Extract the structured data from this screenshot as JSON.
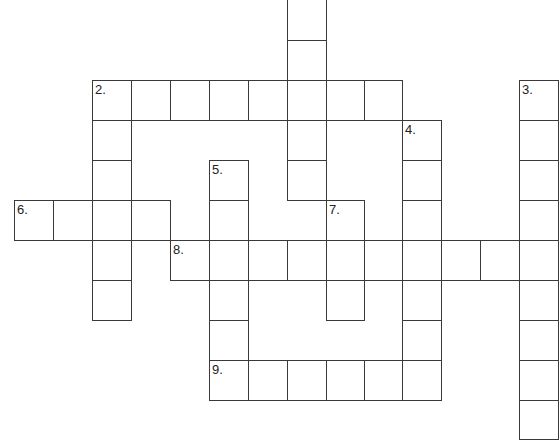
{
  "puzzle": {
    "type": "crossword",
    "cell_size": 39,
    "col_x": [
      14,
      53,
      92,
      131,
      170,
      209,
      248,
      287,
      326,
      364,
      402,
      441,
      480,
      519
    ],
    "row_y": [
      -1,
      40,
      80,
      120,
      160,
      200,
      240,
      280,
      320,
      360,
      400
    ],
    "clue_numbers": [
      "1",
      "2.",
      "3.",
      "4.",
      "5.",
      "6.",
      "7.",
      "8.",
      "9."
    ],
    "words": [
      {
        "number": "1",
        "label": "",
        "direction": "down",
        "col": 7,
        "row": 0,
        "length": 5
      },
      {
        "number": "2",
        "label": "2.",
        "direction": "across",
        "col": 2,
        "row": 2,
        "length": 8
      },
      {
        "number": "2",
        "label": "",
        "direction": "down",
        "col": 2,
        "row": 2,
        "length": 6
      },
      {
        "number": "3",
        "label": "3.",
        "direction": "down",
        "col": 13,
        "row": 2,
        "length": 9
      },
      {
        "number": "4",
        "label": "4.",
        "direction": "down",
        "col": 10,
        "row": 3,
        "length": 7
      },
      {
        "number": "5",
        "label": "5.",
        "direction": "down",
        "col": 5,
        "row": 4,
        "length": 6
      },
      {
        "number": "6",
        "label": "6.",
        "direction": "across",
        "col": 0,
        "row": 5,
        "length": 4
      },
      {
        "number": "7",
        "label": "7.",
        "direction": "down",
        "col": 8,
        "row": 5,
        "length": 3
      },
      {
        "number": "8",
        "label": "8.",
        "direction": "across",
        "col": 4,
        "row": 6,
        "length": 10
      },
      {
        "number": "9",
        "label": "9.",
        "direction": "across",
        "col": 5,
        "row": 9,
        "length": 6
      }
    ]
  }
}
